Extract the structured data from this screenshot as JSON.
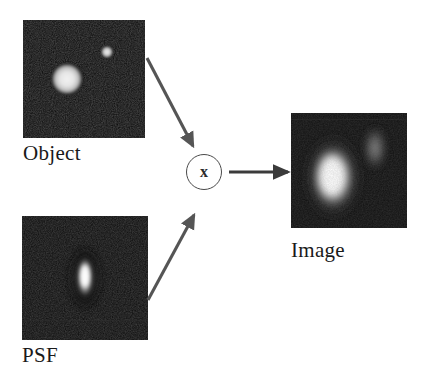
{
  "figure": {
    "background_color": "#ffffff",
    "width": 422,
    "height": 381
  },
  "panels": [
    {
      "id": "object",
      "label": "Object",
      "role": "input-object",
      "background_color": "#0a0a0a",
      "description": "Dark noisy field containing two bright circular point sources",
      "features": [
        {
          "name": "large-blob",
          "shape": "circle",
          "cx_pct": 36,
          "cy_pct": 50,
          "radius_pct": 13,
          "brightness": "high"
        },
        {
          "name": "small-blob",
          "shape": "circle",
          "cx_pct": 69,
          "cy_pct": 27,
          "radius_pct": 5,
          "brightness": "high"
        }
      ]
    },
    {
      "id": "psf",
      "label": "PSF",
      "role": "input-kernel",
      "background_color": "#0a0a0a",
      "description": "Dark noisy field with a single vertically elongated bright kernel near center",
      "features": [
        {
          "name": "kernel-lobe",
          "shape": "ellipse",
          "cx_pct": 50,
          "cy_pct": 50,
          "rx_pct": 7,
          "ry_pct": 17,
          "brightness": "high"
        }
      ]
    },
    {
      "id": "image",
      "label": "Image",
      "role": "output",
      "background_color": "#0a0a0a",
      "description": "Blurred result: large bright elongated lobe left of center and a faint elongated lobe upper right",
      "features": [
        {
          "name": "primary-lobe",
          "shape": "ellipse",
          "cx_pct": 36,
          "cy_pct": 56,
          "rx_pct": 19,
          "ry_pct": 28,
          "brightness": "high"
        },
        {
          "name": "secondary-lobe",
          "shape": "ellipse",
          "cx_pct": 72,
          "cy_pct": 30,
          "rx_pct": 9,
          "ry_pct": 18,
          "brightness": "low"
        }
      ]
    }
  ],
  "operator": {
    "symbol": "x",
    "meaning": "convolution",
    "shape": "circle",
    "stroke_color": "#4a4a4a"
  },
  "arrows": [
    {
      "name": "object-to-operator",
      "from": "object",
      "to": "operator",
      "color": "#555555"
    },
    {
      "name": "psf-to-operator",
      "from": "psf",
      "to": "operator",
      "color": "#555555"
    },
    {
      "name": "operator-to-image",
      "from": "operator",
      "to": "image",
      "color": "#3b3b3b"
    }
  ],
  "colors": {
    "panel_background": "#0a0a0a",
    "arrow": "#555555",
    "arrow_output": "#3b3b3b",
    "text": "#1a1a1a",
    "page_background": "#ffffff"
  }
}
